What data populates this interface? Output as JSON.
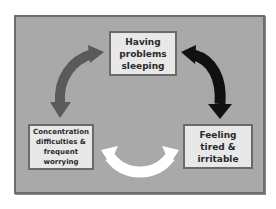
{
  "diagram": {
    "title": "",
    "type": "cycle",
    "background_color": "#a9a9a9",
    "nodes": [
      {
        "id": "top",
        "label": "Having\nproblems\nsleeping"
      },
      {
        "id": "left",
        "label": "Concentration\ndifficulties &\nfrequent\nworrying"
      },
      {
        "id": "right",
        "label": "Feeling\ntired &\nirritable"
      }
    ],
    "edges": [
      {
        "from": "top",
        "to": "left",
        "direction": "bidirectional",
        "color": "#5a5a5a",
        "icon": "curved-double-arrow-icon"
      },
      {
        "from": "top",
        "to": "right",
        "direction": "bidirectional",
        "color": "#111111",
        "icon": "curved-double-arrow-icon"
      },
      {
        "from": "left",
        "to": "right",
        "direction": "bidirectional",
        "color": "#ffffff",
        "icon": "curved-double-arrow-icon"
      }
    ]
  }
}
